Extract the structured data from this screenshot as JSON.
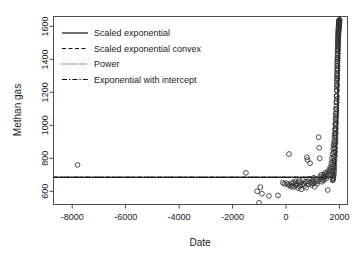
{
  "chart_data": {
    "type": "scatter",
    "title": "",
    "xlabel": "Date",
    "ylabel": "Methan gas",
    "xlim": [
      -8700,
      2300
    ],
    "ylim": [
      520,
      1660
    ],
    "xticks": [
      -8000,
      -6000,
      -4000,
      -2000,
      0,
      2000
    ],
    "xtick_labels": [
      "-8000",
      "-6000",
      "-4000",
      "-2000",
      "0",
      "2000"
    ],
    "yticks": [
      600,
      800,
      1000,
      1200,
      1400,
      1600
    ],
    "ytick_labels": [
      "600",
      "800",
      "1000",
      "1200",
      "1400",
      "1600"
    ],
    "grid": false,
    "legend_position": "top-left",
    "point_marker": "open-circle",
    "series": [
      {
        "name": "Observations",
        "marker": "circle",
        "points": [
          [
            -7800,
            760
          ],
          [
            -1500,
            712
          ],
          [
            -1080,
            600
          ],
          [
            -1010,
            530
          ],
          [
            -960,
            625
          ],
          [
            -900,
            585
          ],
          [
            -640,
            572
          ],
          [
            -300,
            575
          ],
          [
            -120,
            652
          ],
          [
            -60,
            645
          ],
          [
            20,
            650
          ],
          [
            60,
            640
          ],
          [
            110,
            826
          ],
          [
            140,
            638
          ],
          [
            180,
            628
          ],
          [
            210,
            648
          ],
          [
            240,
            632
          ],
          [
            270,
            655
          ],
          [
            300,
            626
          ],
          [
            330,
            644
          ],
          [
            360,
            660
          ],
          [
            390,
            636
          ],
          [
            420,
            648
          ],
          [
            450,
            620
          ],
          [
            480,
            662
          ],
          [
            510,
            630
          ],
          [
            540,
            655
          ],
          [
            570,
            612
          ],
          [
            600,
            640
          ],
          [
            630,
            668
          ],
          [
            660,
            646
          ],
          [
            690,
            634
          ],
          [
            720,
            656
          ],
          [
            750,
            622
          ],
          [
            780,
            806
          ],
          [
            800,
            790
          ],
          [
            820,
            660
          ],
          [
            850,
            644
          ],
          [
            880,
            676
          ],
          [
            900,
            770
          ],
          [
            920,
            652
          ],
          [
            950,
            638
          ],
          [
            980,
            664
          ],
          [
            1010,
            648
          ],
          [
            1040,
            682
          ],
          [
            1070,
            628
          ],
          [
            1100,
            658
          ],
          [
            1130,
            670
          ],
          [
            1160,
            646
          ],
          [
            1190,
            660
          ],
          [
            1220,
            928
          ],
          [
            1240,
            864
          ],
          [
            1260,
            800
          ],
          [
            1280,
            690
          ],
          [
            1300,
            676
          ],
          [
            1320,
            700
          ],
          [
            1340,
            658
          ],
          [
            1360,
            672
          ],
          [
            1380,
            688
          ],
          [
            1400,
            666
          ],
          [
            1420,
            700
          ],
          [
            1440,
            684
          ],
          [
            1460,
            712
          ],
          [
            1480,
            694
          ],
          [
            1500,
            676
          ],
          [
            1520,
            706
          ],
          [
            1540,
            690
          ],
          [
            1560,
            608
          ],
          [
            1580,
            720
          ],
          [
            1600,
            700
          ],
          [
            1620,
            732
          ],
          [
            1640,
            714
          ],
          [
            1660,
            748
          ],
          [
            1680,
            726
          ],
          [
            1700,
            770
          ],
          [
            1710,
            742
          ],
          [
            1720,
            800
          ],
          [
            1730,
            762
          ],
          [
            1740,
            826
          ],
          [
            1750,
            784
          ],
          [
            1760,
            856
          ],
          [
            1770,
            808
          ],
          [
            1780,
            880
          ],
          [
            1790,
            836
          ],
          [
            1800,
            900
          ],
          [
            1805,
            862
          ],
          [
            1810,
            930
          ],
          [
            1815,
            886
          ],
          [
            1820,
            950
          ],
          [
            1825,
            908
          ],
          [
            1830,
            978
          ],
          [
            1835,
            940
          ],
          [
            1840,
            1010
          ],
          [
            1845,
            968
          ],
          [
            1850,
            1040
          ],
          [
            1855,
            1000
          ],
          [
            1860,
            1070
          ],
          [
            1865,
            1030
          ],
          [
            1870,
            1100
          ],
          [
            1875,
            1060
          ],
          [
            1880,
            1140
          ],
          [
            1885,
            1096
          ],
          [
            1890,
            1180
          ],
          [
            1893,
            1140
          ],
          [
            1896,
            1215
          ],
          [
            1899,
            1175
          ],
          [
            1902,
            1250
          ],
          [
            1905,
            1210
          ],
          [
            1908,
            1285
          ],
          [
            1910,
            1245
          ],
          [
            1912,
            1315
          ],
          [
            1914,
            1280
          ],
          [
            1916,
            1345
          ],
          [
            1918,
            1305
          ],
          [
            1920,
            1375
          ],
          [
            1922,
            1338
          ],
          [
            1924,
            1400
          ],
          [
            1926,
            1362
          ],
          [
            1928,
            1425
          ],
          [
            1930,
            1390
          ],
          [
            1932,
            1450
          ],
          [
            1934,
            1412
          ],
          [
            1936,
            1470
          ],
          [
            1938,
            1436
          ],
          [
            1940,
            1492
          ],
          [
            1942,
            1458
          ],
          [
            1944,
            1510
          ],
          [
            1946,
            1478
          ],
          [
            1948,
            1528
          ],
          [
            1950,
            1496
          ],
          [
            1952,
            1545
          ],
          [
            1954,
            1515
          ],
          [
            1956,
            1560
          ],
          [
            1958,
            1532
          ],
          [
            1960,
            1575
          ],
          [
            1962,
            1548
          ],
          [
            1964,
            1588
          ],
          [
            1966,
            1562
          ],
          [
            1968,
            1598
          ],
          [
            1970,
            1575
          ],
          [
            1972,
            1606
          ],
          [
            1974,
            1586
          ],
          [
            1976,
            1614
          ],
          [
            1978,
            1594
          ],
          [
            1980,
            1620
          ],
          [
            1982,
            1602
          ],
          [
            1984,
            1626
          ],
          [
            1986,
            1608
          ],
          [
            1988,
            1630
          ],
          [
            1990,
            1614
          ],
          [
            1992,
            1634
          ],
          [
            1994,
            1618
          ],
          [
            1996,
            1636
          ],
          [
            1998,
            1622
          ],
          [
            2000,
            1638
          ],
          [
            1900,
            1160
          ],
          [
            1904,
            1232
          ],
          [
            1907,
            1268
          ],
          [
            1911,
            1298
          ],
          [
            1915,
            1330
          ],
          [
            1919,
            1360
          ],
          [
            1923,
            1386
          ],
          [
            1927,
            1408
          ],
          [
            1931,
            1434
          ],
          [
            1935,
            1462
          ],
          [
            1939,
            1484
          ],
          [
            1943,
            1504
          ],
          [
            1947,
            1522
          ],
          [
            1951,
            1540
          ],
          [
            1955,
            1556
          ],
          [
            1959,
            1570
          ],
          [
            1963,
            1582
          ],
          [
            1967,
            1592
          ],
          [
            1971,
            1600
          ],
          [
            1975,
            1610
          ],
          [
            1979,
            1616
          ],
          [
            1983,
            1622
          ],
          [
            1987,
            1628
          ],
          [
            1991,
            1632
          ],
          [
            1995,
            1635
          ],
          [
            1999,
            1640
          ],
          [
            1886,
            1118
          ],
          [
            1882,
            1080
          ],
          [
            1878,
            1048
          ],
          [
            1874,
            1014
          ],
          [
            1868,
            982
          ],
          [
            1862,
            952
          ],
          [
            1856,
            922
          ],
          [
            1848,
            892
          ],
          [
            1842,
            864
          ],
          [
            1836,
            840
          ],
          [
            1828,
            816
          ],
          [
            1822,
            792
          ],
          [
            1816,
            772
          ],
          [
            1808,
            752
          ],
          [
            1802,
            736
          ],
          [
            1796,
            720
          ],
          [
            1788,
            706
          ],
          [
            1782,
            698
          ],
          [
            1774,
            688
          ],
          [
            1766,
            680
          ],
          [
            1758,
            676
          ],
          [
            1752,
            670
          ],
          [
            1744,
            666
          ]
        ]
      }
    ],
    "fits": [
      {
        "name": "Scaled exponential",
        "style": "solid",
        "description": "near-flat line at about 685 rising steeply after 1900"
      },
      {
        "name": "Scaled exponential convex",
        "style": "dashed",
        "description": "overlapping the solid fit"
      },
      {
        "name": "Power",
        "style": "dotted",
        "description": "overlapping the solid fit"
      },
      {
        "name": "Exponential with intercept",
        "style": "dashdot",
        "description": "overlapping the solid fit"
      }
    ]
  },
  "legend": {
    "entries": [
      {
        "label": "Scaled exponential",
        "style": "solid"
      },
      {
        "label": "Scaled exponential convex",
        "style": "dashed"
      },
      {
        "label": "Power",
        "style": "dotted"
      },
      {
        "label": "Exponential with intercept",
        "style": "dashdot"
      }
    ]
  },
  "colors": {
    "background": "#ffffff",
    "axis": "#4d4d4d",
    "text": "#1a1a1a",
    "point": "#333333",
    "fit": "#111111"
  }
}
